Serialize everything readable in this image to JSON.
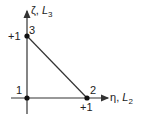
{
  "diagram": {
    "axes": {
      "vertical": {
        "symbol": "ζ",
        "sep": ", ",
        "var": "L",
        "sub": "3"
      },
      "horizontal": {
        "symbol": "η",
        "sep": ", ",
        "var": "L",
        "sub": "2"
      }
    },
    "nodes": [
      {
        "id": "1",
        "label": "1",
        "x": 27,
        "y": 98
      },
      {
        "id": "2",
        "label": "2",
        "x": 87,
        "y": 98
      },
      {
        "id": "3",
        "label": "3",
        "x": 27,
        "y": 36
      }
    ],
    "ticks": {
      "vertical": "+1",
      "horizontal": "+1"
    },
    "colors": {
      "line": "#333333",
      "node": "#111111"
    }
  }
}
